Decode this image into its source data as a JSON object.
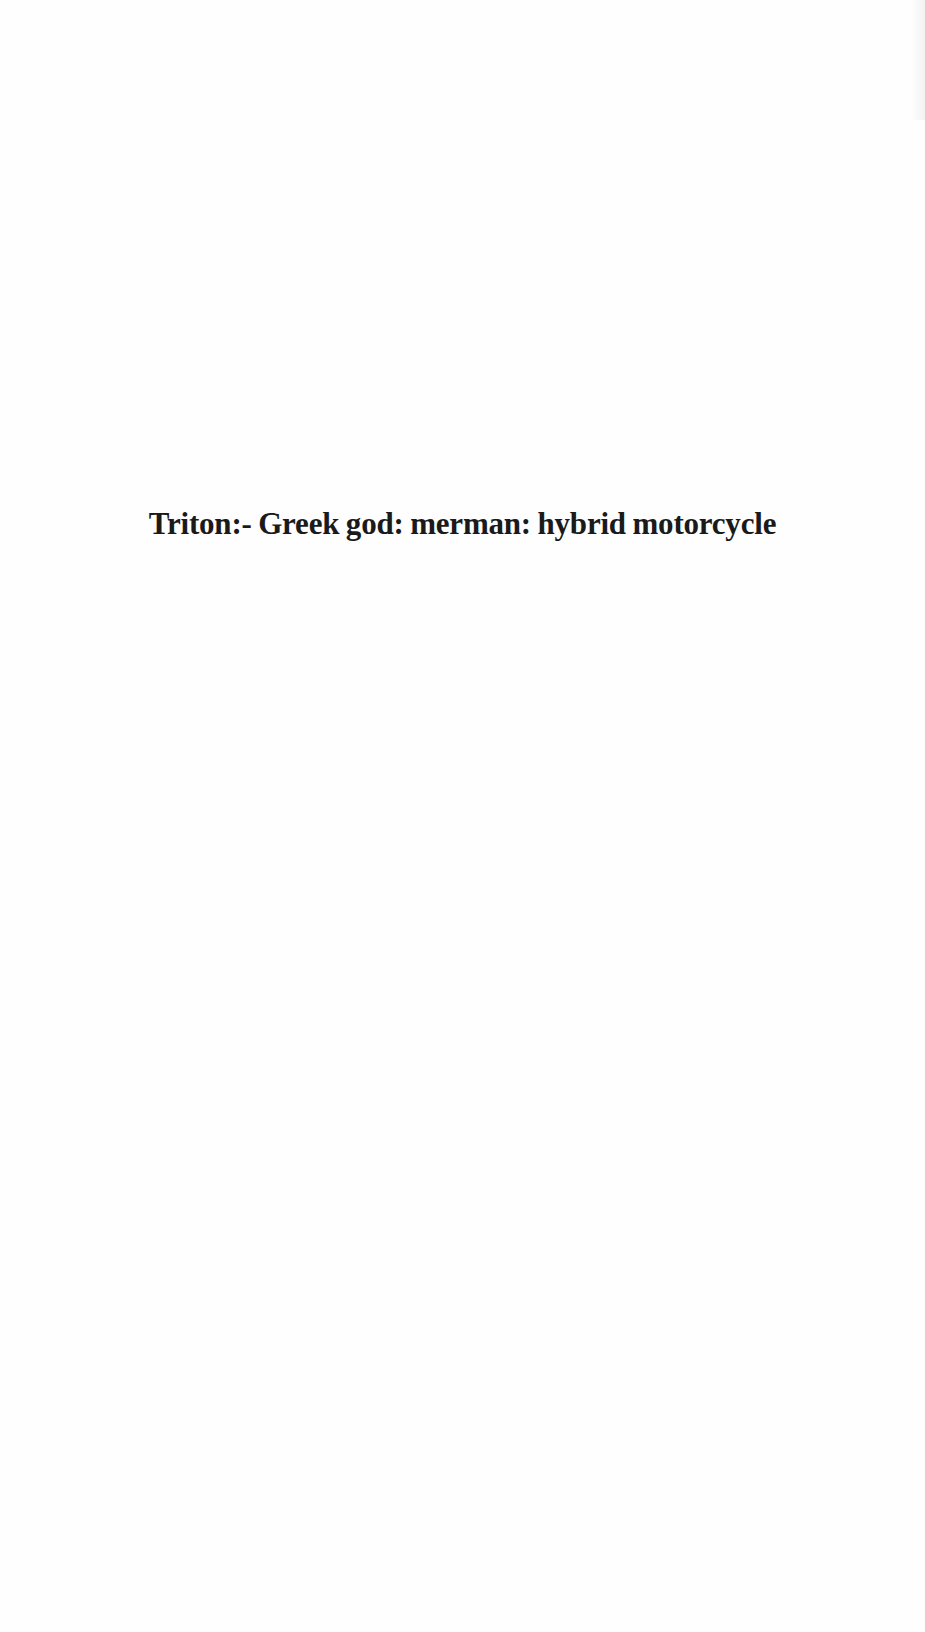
{
  "document": {
    "title_line": "Triton:- Greek god: merman: hybrid motorcycle"
  }
}
